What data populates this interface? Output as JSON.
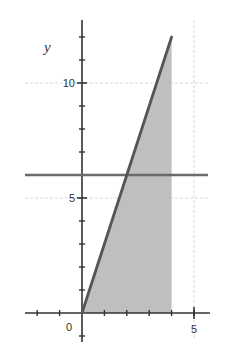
{
  "chart_data": {
    "type": "line",
    "title": "",
    "xlabel": "",
    "ylabel": "y",
    "xlim": [
      -2.6,
      5.7
    ],
    "ylim": [
      -1.2,
      12.6
    ],
    "x_ticks": {
      "major": [
        0,
        5
      ],
      "minor": [
        -2,
        -1,
        1,
        2,
        3,
        4,
        5
      ]
    },
    "y_ticks": {
      "major": [
        5,
        10
      ],
      "minor": [
        -1,
        1,
        2,
        3,
        4,
        6,
        7,
        8,
        9,
        11,
        12
      ]
    },
    "x_tick_labels": [
      "0",
      "5"
    ],
    "y_tick_labels": [
      "5",
      "10"
    ],
    "grid": {
      "horizontal": [
        5,
        10
      ],
      "vertical": [
        5
      ],
      "style": "dashed-light"
    },
    "series": [
      {
        "name": "y = 3x",
        "kind": "line",
        "x": [
          0,
          4
        ],
        "y": [
          0,
          12
        ],
        "color": "#555555"
      },
      {
        "name": "y = 6",
        "kind": "hline",
        "y": 6,
        "x_range": [
          -2.6,
          5.6
        ],
        "color": "#666666"
      }
    ],
    "shaded_region": {
      "description": "Region under y = 3x above x-axis, from x = 0 to x = 4",
      "vertices": [
        [
          0,
          0
        ],
        [
          4,
          12
        ],
        [
          4,
          0
        ]
      ],
      "color": "#bdbdbd"
    }
  },
  "colors": {
    "axis": "#333333",
    "line": "#555555",
    "hline": "#6a6a6a",
    "fill": "#bfbfbf",
    "grid": "#d8d8d8"
  }
}
